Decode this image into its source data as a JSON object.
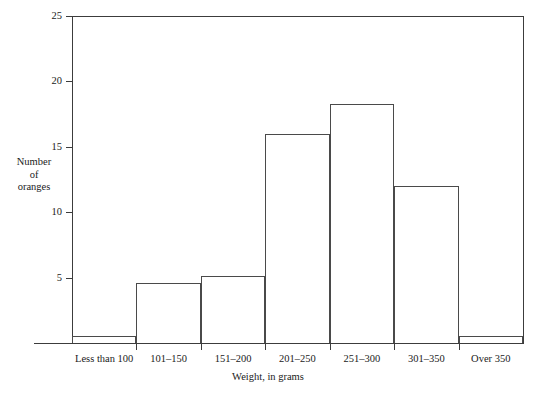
{
  "chart_data": {
    "type": "bar",
    "title": "",
    "subtitle": "",
    "xlabel": "Weight, in grams",
    "ylabel": "Number of oranges",
    "ylabel_lines": [
      "Number",
      "of",
      "oranges"
    ],
    "categories": [
      "Less than 100",
      "101–150",
      "151–200",
      "201–250",
      "251–300",
      "301–350",
      "Over 350"
    ],
    "values": [
      0.5,
      4.6,
      5.1,
      16.0,
      18.3,
      12.0,
      0.5
    ],
    "ylim": [
      0,
      25
    ],
    "xlim_categories": 7,
    "yticks": [
      5,
      10,
      15,
      20,
      25
    ],
    "ytick_labels": [
      "5",
      "10",
      "15",
      "20",
      "25"
    ],
    "grid": false,
    "legend": null,
    "bar_fill": "#ffffff",
    "bar_stroke": "#4a4a4a",
    "axis_color": "#3c3c3c",
    "text_color": "#1a1a1a",
    "background": "#ffffff"
  }
}
